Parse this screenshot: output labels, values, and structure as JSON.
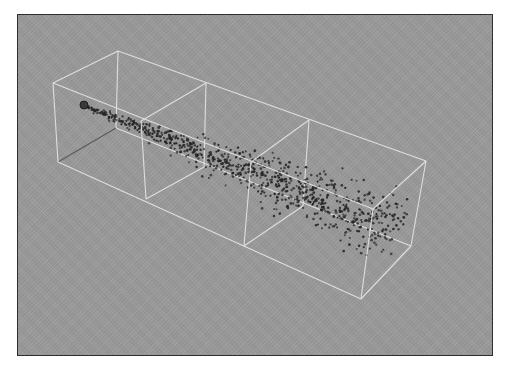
{
  "scene": {
    "title": "3D particle stream in wireframe container",
    "colors": {
      "background": "#9b9b9b",
      "frame_border": "#2e2e2e",
      "wireframe": "#e6e6e6",
      "hidden_edge": "#5a5a5a",
      "particle": "#262626"
    },
    "box": {
      "vertices": {
        "front_top_left": [
          52,
          82
        ],
        "front_bottom_left": [
          57,
          161
        ],
        "back_top_left": [
          117,
          50
        ],
        "back_bottom_left": [
          115,
          127
        ],
        "front_top_right": [
          372,
          208
        ],
        "front_bottom_right": [
          360,
          298
        ],
        "back_top_right": [
          425,
          160
        ],
        "back_bottom_right": [
          410,
          245
        ]
      },
      "dividers": [
        {
          "front_top": [
            140,
            120
          ],
          "front_bottom": [
            145,
            198
          ],
          "back_top": [
            205,
            82
          ],
          "back_bottom": [
            203,
            166
          ]
        },
        {
          "front_top": [
            250,
            161
          ],
          "front_bottom": [
            243,
            245
          ],
          "back_top": [
            308,
            119
          ],
          "back_bottom": [
            302,
            205
          ]
        }
      ]
    },
    "emitter": {
      "center": [
        83,
        104
      ],
      "radius": 4
    },
    "stream": {
      "start": [
        86,
        106
      ],
      "end": [
        398,
        228
      ],
      "count": 820,
      "spread_start": 2,
      "spread_end": 38,
      "seed": 7
    }
  }
}
